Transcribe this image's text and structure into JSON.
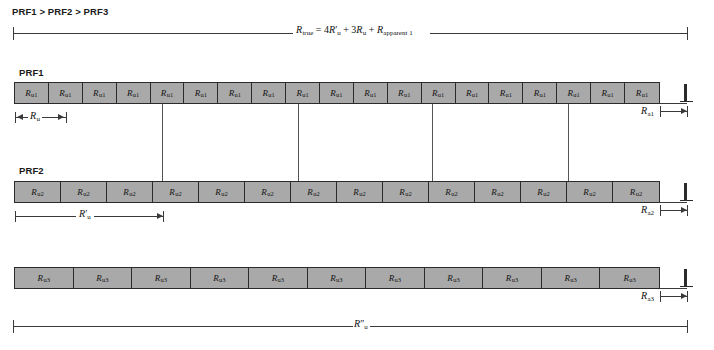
{
  "figure": {
    "caption_top": "PRF1 > PRF2 > PRF3",
    "true_range_equation": {
      "lhs_symbol": "R",
      "lhs_sub": "true",
      "equals": "=",
      "term1_coeff": "4",
      "term1_symbol": "R",
      "term1_sub": "u",
      "term1_prime": "′",
      "plus1": "+",
      "term2_coeff": "3",
      "term2_symbol": "R",
      "term2_sub": "u",
      "plus2": "+",
      "term3_symbol": "R",
      "term3_sub": "apparent 1",
      "full_text": "R_true = 4R'_u + 3R_u + R_apparent 1"
    }
  },
  "rows": [
    {
      "id": "prf1",
      "title": "PRF1",
      "cell_label_symbol": "R",
      "cell_label_sub": "u1",
      "cell_count": 19,
      "apparent_range": {
        "symbol": "R",
        "sub": "a1"
      },
      "dimension": {
        "symbol": "R",
        "sub": "u",
        "prime": ""
      }
    },
    {
      "id": "prf2",
      "title": "PRF2",
      "cell_label_symbol": "R",
      "cell_label_sub": "u2",
      "cell_count": 14,
      "apparent_range": {
        "symbol": "R",
        "sub": "a2"
      },
      "dimension": {
        "symbol": "R",
        "sub": "u",
        "prime": "′"
      }
    },
    {
      "id": "prf3",
      "title": "",
      "cell_label_symbol": "R",
      "cell_label_sub": "u3",
      "cell_count": 11,
      "apparent_range": {
        "symbol": "R",
        "sub": "a3"
      },
      "dimension": {
        "symbol": "R",
        "sub": "u",
        "prime": "″"
      }
    }
  ],
  "colors": {
    "cell_fill": "#a9a9a9",
    "cell_border": "#2b2b2b",
    "line": "#3a3a3a",
    "text": "#111111",
    "background": "#ffffff"
  }
}
